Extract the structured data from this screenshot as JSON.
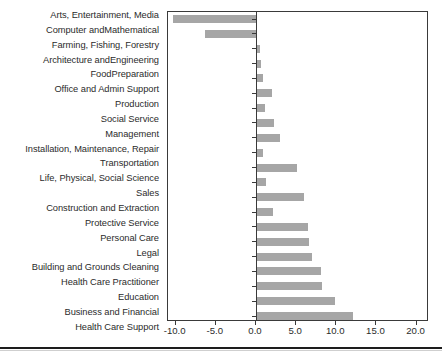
{
  "chart_data": {
    "type": "bar",
    "orientation": "horizontal",
    "title": "",
    "subtitle": "",
    "xlabel": "",
    "ylabel": "",
    "xlim": [
      -10.0,
      20.0
    ],
    "xticks": [
      "-10.0",
      "-5.0",
      "0.0",
      "5.0",
      "10.0",
      "15.0",
      "20.0"
    ],
    "xtick_values": [
      -10.0,
      -5.0,
      0.0,
      5.0,
      10.0,
      15.0,
      20.0
    ],
    "grid": false,
    "legend": false,
    "legend_position": "none",
    "bar_color": "#a6a6a6",
    "axis_color": "#3a3a3a",
    "text_color": "#2b2b2b",
    "background": "#ffffff",
    "categories": [
      "Arts, Entertainment, Media",
      "Computer andMathematical",
      "Farming, Fishing, Forestry",
      "Architecture andEngineering",
      "FoodPreparation",
      "Office and Admin Support",
      "Production",
      "Social Service",
      "Management",
      "Installation, Maintenance, Repair",
      "Transportation",
      "Life, Physical, Social Science",
      "Sales",
      "Construction and Extraction",
      "Protective Service",
      "Personal Care",
      "Legal",
      "Building and Grounds Cleaning",
      "Health Care Practitioner",
      "Education",
      "Business and Financial",
      "Health Care Support"
    ],
    "values": [
      -10.3,
      -6.3,
      0.4,
      0.5,
      0.7,
      1.9,
      1.0,
      2.1,
      2.9,
      0.8,
      5.0,
      1.1,
      5.9,
      2.0,
      6.4,
      6.5,
      6.8,
      8.0,
      8.1,
      9.7,
      12.0,
      19.3
    ]
  }
}
